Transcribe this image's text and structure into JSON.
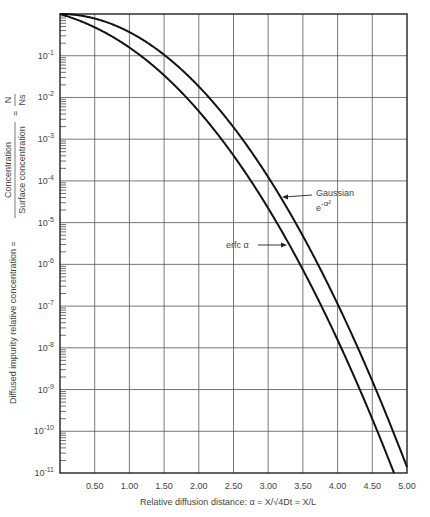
{
  "chart_data": {
    "type": "line",
    "title": "",
    "xlabel": "Relative diffusion distance:  α = X/√4Dt = X/L",
    "ylabel": "Diffused impurity relative concentration = Concentration / Surface concentration = N/Ns",
    "ylabel_parts": {
      "prefix": "Diffused impurity relative concentration",
      "numerator": "Concentration",
      "denominator": "Surface concentration",
      "frac_num": "N",
      "frac_den": "Ns"
    },
    "xscale": "linear",
    "yscale": "log",
    "xlim": [
      0,
      5.0
    ],
    "ylim": [
      1e-11,
      1
    ],
    "grid": true,
    "x_ticks": [
      0.5,
      1.0,
      1.5,
      2.0,
      2.5,
      3.0,
      3.5,
      4.0,
      4.5,
      5.0
    ],
    "x_tick_labels": [
      "0.50",
      "1.00",
      "1.50",
      "2.00",
      "2.50",
      "3.00",
      "3.50",
      "4.00",
      "4.50",
      "5.00"
    ],
    "y_ticks": [
      0.1,
      0.01,
      0.001,
      0.0001,
      1e-05,
      1e-06,
      1e-07,
      1e-08,
      1e-09,
      1e-10,
      1e-11
    ],
    "y_tick_exponents": [
      "-1",
      "-2",
      "-3",
      "-4",
      "-5",
      "-6",
      "-7",
      "-8",
      "-9",
      "-10",
      "-11"
    ],
    "series": [
      {
        "name": "Gaussian e^(-α²)",
        "function": "gaussian",
        "x": [
          0,
          0.5,
          1.0,
          1.5,
          2.0,
          2.5,
          3.0,
          3.5,
          4.0,
          4.5,
          5.0
        ],
        "values": [
          1.0,
          0.7788,
          0.3679,
          0.1054,
          0.01832,
          0.00193,
          0.0001234,
          4.785e-06,
          1.125e-07,
          1.605e-09,
          1.389e-11
        ]
      },
      {
        "name": "erfc α",
        "function": "erfc",
        "x": [
          0,
          0.5,
          1.0,
          1.5,
          2.0,
          2.5,
          3.0,
          3.5,
          4.0,
          4.5,
          4.78
        ],
        "values": [
          1.0,
          0.4795,
          0.1573,
          0.03389,
          0.004678,
          0.000407,
          2.209e-05,
          7.43e-07,
          1.542e-08,
          1.966e-10,
          1e-11
        ]
      }
    ],
    "annotations": [
      {
        "text": "Gaussian",
        "target": "Gaussian e^(-α²)"
      },
      {
        "text": "e",
        "sup": "-α²",
        "target": "Gaussian e^(-α²)"
      },
      {
        "text": "erfc α",
        "target": "erfc α"
      }
    ],
    "legend": "none (inline annotations with arrows)"
  }
}
